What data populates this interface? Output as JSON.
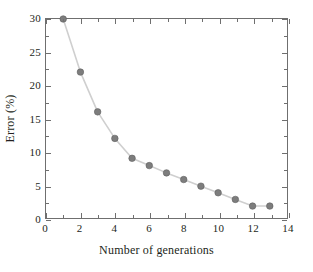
{
  "chart_data": {
    "type": "line",
    "title": "",
    "subtitle": "",
    "xlabel": "Number of generations",
    "ylabel": "Error (%)",
    "xlim": [
      0,
      14
    ],
    "ylim": [
      0,
      30
    ],
    "xticks": [
      0,
      2,
      4,
      6,
      8,
      10,
      12,
      14
    ],
    "yticks": [
      0,
      5,
      10,
      15,
      20,
      25,
      30
    ],
    "xtick_labels": [
      "0",
      "2",
      "4",
      "6",
      "8",
      "10",
      "12",
      "14"
    ],
    "ytick_labels": [
      "0",
      "5",
      "10",
      "15",
      "20",
      "25",
      "30"
    ],
    "x_minor_step": 1,
    "y_minor_step": 2.5,
    "grid": false,
    "legend": null,
    "legend_position": "none",
    "frame": "box",
    "tick_direction": "in",
    "series": [
      {
        "name": "Error",
        "marker": "circle",
        "marker_color": "#7d7d7d",
        "line_color": "#cfcfcf",
        "x": [
          1,
          2,
          3,
          4,
          5,
          6,
          7,
          8,
          9,
          10,
          11,
          12,
          13
        ],
        "values": [
          30.0,
          22.0,
          16.0,
          12.0,
          9.0,
          7.9,
          6.8,
          5.8,
          4.8,
          3.8,
          2.8,
          1.8,
          1.8
        ]
      }
    ],
    "annotations": []
  },
  "colors": {
    "marker": "#7d7d7d",
    "marker_edge": "#5f5f5f",
    "line": "#cfcfcf",
    "axis": "#6f6f6f",
    "text": "#231f20",
    "background": "#ffffff"
  }
}
